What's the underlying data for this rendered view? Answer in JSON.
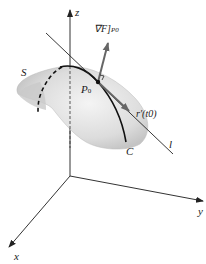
{
  "figure": {
    "axes": {
      "x_label": "x",
      "y_label": "y",
      "z_label": "z"
    },
    "surface_label": "S",
    "curve_label": "C",
    "tangent_line_label": "l",
    "point_label": {
      "main": "P",
      "sub": "0"
    },
    "gradient_label": {
      "main": "∇F]",
      "sub": "P0"
    },
    "tangent_vector_label": "r′(t0)",
    "colors": {
      "surface": "#d9d9d9",
      "vector": "#666666",
      "lines": "#222222"
    }
  }
}
